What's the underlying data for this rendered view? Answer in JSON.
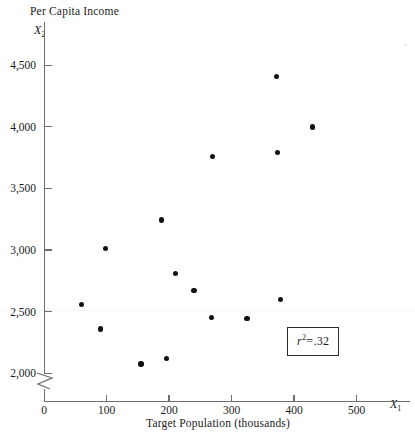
{
  "figure": {
    "y_axis_title": "Per Capita Income",
    "y_axis_symbol": "X",
    "y_axis_symbol_sub": "2",
    "x_axis_title": "Target Population (thousands)",
    "x_axis_symbol": "X",
    "x_axis_symbol_sub": "1",
    "annotation": {
      "symbol": "r",
      "exponent": "2",
      "equals": "=",
      "value": ".32",
      "full_text": "r2 = .32"
    }
  },
  "chart_data": {
    "type": "scatter",
    "title": "",
    "xlabel": "Target Population (thousands)",
    "ylabel": "Per Capita Income",
    "x_symbol": "X1",
    "y_symbol": "X2",
    "xlim": [
      0,
      560
    ],
    "ylim": [
      1900,
      4650
    ],
    "y_axis_break": true,
    "grid": false,
    "legend": false,
    "xticks": [
      0,
      100,
      200,
      300,
      400,
      500
    ],
    "xtick_labels": [
      "0",
      "100",
      "200",
      "300",
      "400",
      "500"
    ],
    "yticks": [
      2000,
      2500,
      3000,
      3500,
      4000,
      4500
    ],
    "ytick_labels": [
      "2,000",
      "2,500",
      "3,000",
      "3,500",
      "4,000",
      "4,500"
    ],
    "annotations": [
      {
        "text": "r2 = .32",
        "x": 390,
        "y": 2420,
        "boxed": true
      }
    ],
    "n_points": 14,
    "points": [
      {
        "x": 60,
        "y": 2560
      },
      {
        "x": 90,
        "y": 2360
      },
      {
        "x": 98,
        "y": 3010
      },
      {
        "x": 155,
        "y": 2075
      },
      {
        "x": 188,
        "y": 3245
      },
      {
        "x": 196,
        "y": 2120
      },
      {
        "x": 210,
        "y": 2810
      },
      {
        "x": 240,
        "y": 2670
      },
      {
        "x": 268,
        "y": 2450
      },
      {
        "x": 270,
        "y": 3760
      },
      {
        "x": 325,
        "y": 2445
      },
      {
        "x": 372,
        "y": 4410
      },
      {
        "x": 374,
        "y": 3790
      },
      {
        "x": 378,
        "y": 2600
      },
      {
        "x": 430,
        "y": 4000
      }
    ]
  }
}
